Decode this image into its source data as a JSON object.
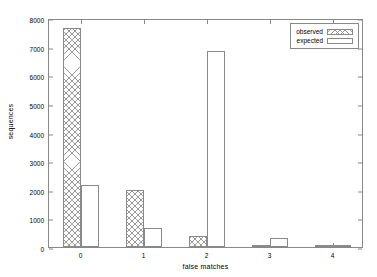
{
  "chart_data": {
    "type": "bar",
    "title": "",
    "xlabel": "false matches",
    "ylabel": "sequences",
    "categories": [
      "0",
      "1",
      "2",
      "3",
      "4"
    ],
    "series": [
      {
        "name": "observed",
        "values": [
          7650,
          1990,
          380,
          30,
          5
        ]
      },
      {
        "name": "expected",
        "values": [
          2150,
          680,
          6840,
          310,
          40
        ]
      }
    ],
    "ylim": [
      0,
      8000
    ],
    "yticks": [
      0,
      1000,
      2000,
      3000,
      4000,
      5000,
      6000,
      7000,
      8000
    ],
    "ytick_labels": [
      "0",
      "1000",
      "2000",
      "3000",
      "4000",
      "5000",
      "6000",
      "7000",
      "8000"
    ],
    "xtick_labels": [
      "0",
      "1",
      "2",
      "3",
      "4"
    ],
    "grid": false,
    "legend_position": "top-right",
    "legend_entries": [
      "observed",
      "expected"
    ],
    "colors": {
      "axis": "#888888",
      "bar_outline": "#8a8a8a",
      "observed_fill": "#9a9a9a",
      "expected_fill": "#ffffff",
      "text": "#000000",
      "background": "#ffffff"
    }
  }
}
